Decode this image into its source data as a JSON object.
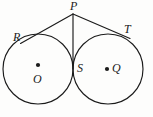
{
  "figure": {
    "background_color": "#fdfdfc",
    "stroke_color": "#1b1b1b",
    "labels": {
      "P": "P",
      "R": "R",
      "T": "T",
      "S": "S",
      "O": "O",
      "Q": "Q"
    },
    "points": {
      "P": {
        "x": 73,
        "y": 14
      },
      "R": {
        "x": 23,
        "y": 42
      },
      "T": {
        "x": 124,
        "y": 35
      },
      "S": {
        "x": 73,
        "y": 69
      },
      "O": {
        "x": 38,
        "y": 69
      },
      "Q": {
        "x": 107,
        "y": 69
      }
    },
    "circles": [
      {
        "name": "circle-O",
        "cx": 38,
        "cy": 69,
        "r": 35
      },
      {
        "name": "circle-Q",
        "cx": 108,
        "cy": 69,
        "r": 35
      }
    ],
    "segments": [
      {
        "name": "segment-PR",
        "from": "P",
        "to": "R"
      },
      {
        "name": "segment-PT",
        "from": "P",
        "to": "T"
      },
      {
        "name": "segment-PS",
        "from": "P",
        "to": "S"
      }
    ],
    "center_dots": [
      {
        "name": "center-dot-O",
        "cx": 38,
        "cy": 65,
        "r": 2.1
      },
      {
        "name": "center-dot-Q",
        "cx": 107,
        "cy": 69,
        "r": 2.1
      }
    ]
  }
}
